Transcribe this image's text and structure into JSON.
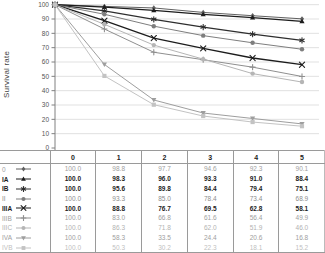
{
  "chart_data": {
    "type": "line",
    "title": "",
    "xlabel": "",
    "ylabel": "Survival rate",
    "ylim": [
      0,
      100
    ],
    "yticks": [
      0,
      10,
      20,
      30,
      40,
      50,
      60,
      70,
      80,
      90,
      100
    ],
    "x": [
      0,
      1,
      2,
      3,
      4,
      5
    ],
    "grid": "horizontal",
    "legend_position": "table-left-column",
    "table_headers": [
      "0",
      "1",
      "2",
      "3",
      "4",
      "5"
    ],
    "series": [
      {
        "name": "0",
        "marker": "diamond",
        "color": "#606060",
        "text_color": "#9e9e9e",
        "bold": false,
        "values": [
          100.0,
          98.8,
          97.7,
          94.6,
          92.3,
          90.1
        ]
      },
      {
        "name": "IA",
        "marker": "triangle-up",
        "color": "#1c1c1c",
        "text_color": "#1c1c1c",
        "bold": true,
        "values": [
          100.0,
          98.3,
          96.0,
          93.3,
          91.0,
          88.4
        ]
      },
      {
        "name": "IB",
        "marker": "asterisk",
        "color": "#2e2e2e",
        "text_color": "#1c1c1c",
        "bold": true,
        "values": [
          100.0,
          95.6,
          89.8,
          84.4,
          79.4,
          75.1
        ]
      },
      {
        "name": "II",
        "marker": "circle",
        "color": "#7e7e7e",
        "text_color": "#8c8c8c",
        "bold": false,
        "values": [
          100.0,
          93.3,
          85.0,
          78.4,
          73.4,
          68.9
        ]
      },
      {
        "name": "IIIA",
        "marker": "x",
        "color": "#1c1c1c",
        "text_color": "#1c1c1c",
        "bold": true,
        "values": [
          100.0,
          88.8,
          76.7,
          69.5,
          62.8,
          58.1
        ]
      },
      {
        "name": "IIIB",
        "marker": "plus",
        "color": "#8f8f8f",
        "text_color": "#9e9e9e",
        "bold": false,
        "values": [
          100.0,
          83.0,
          66.8,
          61.6,
          56.4,
          49.9
        ]
      },
      {
        "name": "IIIC",
        "marker": "circle",
        "color": "#b5b5b5",
        "text_color": "#b2b2b2",
        "bold": false,
        "values": [
          100.0,
          86.3,
          71.8,
          62.0,
          51.9,
          46.0
        ]
      },
      {
        "name": "IVA",
        "marker": "triangle-down",
        "color": "#9e9e9e",
        "text_color": "#9e9e9e",
        "bold": false,
        "values": [
          100.0,
          58.3,
          33.5,
          24.4,
          20.6,
          16.8
        ]
      },
      {
        "name": "IVB",
        "marker": "square",
        "color": "#c3c3c3",
        "text_color": "#bfbfbf",
        "bold": false,
        "values": [
          100.0,
          50.3,
          30.2,
          22.3,
          18.1,
          15.2
        ]
      }
    ],
    "colors": {
      "gridline": "#d9d9d9",
      "axis": "#808080",
      "tick_label": "#555555",
      "table_border": "#9a9a9a"
    }
  }
}
